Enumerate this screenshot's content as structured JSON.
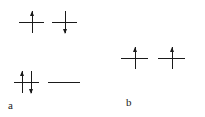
{
  "figure": {
    "type": "orbital-box-electron-configuration-diagram",
    "background_color": "#ffffff",
    "stroke_color": "#1a1a1a",
    "width": 205,
    "height": 117
  },
  "diagrams": [
    {
      "id": "a",
      "label": "a",
      "label_x": 8,
      "label_y": 100,
      "rows": [
        {
          "id": "a-row-top",
          "y": 22,
          "orbitals": [
            {
              "id": "a-orbital-1",
              "x": 19,
              "width": 25,
              "electrons": [
                {
                  "spin": "up",
                  "offset": 13
                }
              ]
            },
            {
              "id": "a-orbital-2",
              "x": 52,
              "width": 25,
              "electrons": [
                {
                  "spin": "down",
                  "offset": 13
                }
              ]
            }
          ]
        },
        {
          "id": "a-row-bottom",
          "y": 82,
          "orbitals": [
            {
              "id": "a-orbital-3",
              "x": 14,
              "width": 25,
              "electrons": [
                {
                  "spin": "up",
                  "offset": 8
                },
                {
                  "spin": "down",
                  "offset": 17
                }
              ]
            },
            {
              "id": "a-orbital-4",
              "x": 48,
              "width": 32,
              "electrons": []
            }
          ]
        }
      ]
    },
    {
      "id": "b",
      "label": "b",
      "label_x": 126,
      "label_y": 97,
      "rows": [
        {
          "id": "b-row-main",
          "y": 58,
          "orbitals": [
            {
              "id": "b-orbital-1",
              "x": 121,
              "width": 27,
              "electrons": [
                {
                  "spin": "up",
                  "offset": 14
                }
              ]
            },
            {
              "id": "b-orbital-2",
              "x": 158,
              "width": 27,
              "electrons": [
                {
                  "spin": "up",
                  "offset": 14
                }
              ]
            }
          ]
        }
      ]
    }
  ]
}
